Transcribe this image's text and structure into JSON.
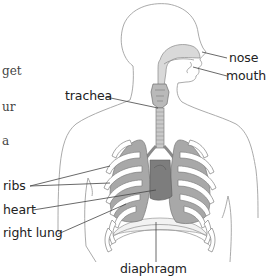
{
  "diagram": {
    "labels": {
      "nose": "nose",
      "mouth": "mouth",
      "trachea": "trachea",
      "ribs": "ribs",
      "heart": "heart",
      "right_lung": "right lung",
      "diaphragm": "diaphragm"
    },
    "cropped_text_fragments": [
      "get",
      "ur",
      "a"
    ],
    "colors": {
      "outline": "#9a9a9a",
      "leader_line": "#444444",
      "lung_fill": "#a8a8a8",
      "lung_stroke": "#777777",
      "rib_fill": "#ffffff",
      "airway_fill": "#d9d9d9",
      "heart_fill": "#7d7d7d",
      "diaphragm_fill": "#f2f2f2",
      "text": "#222222"
    }
  }
}
